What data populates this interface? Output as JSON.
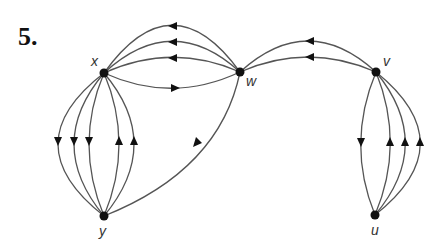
{
  "problem": {
    "number": "5."
  },
  "graph": {
    "type": "directed multigraph",
    "vertices": [
      {
        "id": "x",
        "label": "x"
      },
      {
        "id": "w",
        "label": "w"
      },
      {
        "id": "v",
        "label": "v"
      },
      {
        "id": "y",
        "label": "y"
      },
      {
        "id": "u",
        "label": "u"
      }
    ],
    "edges": [
      {
        "from": "w",
        "to": "x",
        "count": 3
      },
      {
        "from": "x",
        "to": "w",
        "count": 1
      },
      {
        "from": "v",
        "to": "w",
        "count": 2
      },
      {
        "from": "w",
        "to": "y",
        "count": 1
      },
      {
        "from": "x",
        "to": "y",
        "count": 3
      },
      {
        "from": "y",
        "to": "x",
        "count": 2
      },
      {
        "from": "v",
        "to": "u",
        "count": 1
      },
      {
        "from": "u",
        "to": "v",
        "count": 3
      }
    ]
  }
}
